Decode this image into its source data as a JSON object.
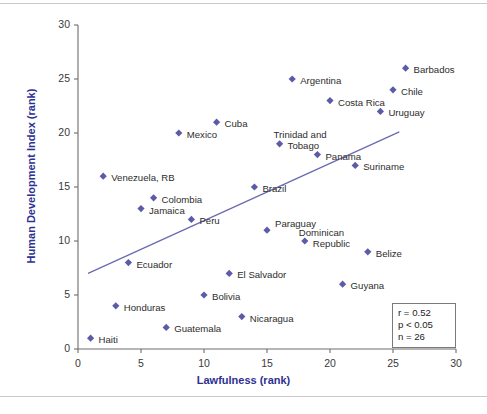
{
  "figure": {
    "xlabel": "Lawfulness (rank)",
    "ylabel": "Human Development Index (rank)",
    "accent_color": "#2e3192",
    "marker_color": "#5b5ba8",
    "trendline_color": "#6a6ab0"
  },
  "stats": {
    "r": "r = 0.52",
    "p": "p < 0.05",
    "n": "n = 26"
  },
  "chart_data": {
    "type": "scatter",
    "title": "",
    "xlabel": "Lawfulness (rank)",
    "ylabel": "Human Development Index (rank)",
    "xlim": [
      0,
      30
    ],
    "ylim": [
      0,
      30
    ],
    "xticks": [
      0,
      5,
      10,
      15,
      20,
      25,
      30
    ],
    "yticks": [
      0,
      5,
      10,
      15,
      20,
      25,
      30
    ],
    "grid": false,
    "legend": "none",
    "annotations": [
      "r = 0.52",
      "p < 0.05",
      "n = 26"
    ],
    "trendline": {
      "x": [
        0.8,
        25.5
      ],
      "y": [
        7.0,
        20.1
      ]
    },
    "points": [
      {
        "label": "Haiti",
        "x": 1,
        "y": 1,
        "lx": 8,
        "ly": -4
      },
      {
        "label": "Venezuela, RB",
        "x": 2,
        "y": 16,
        "lx": 8,
        "ly": -4
      },
      {
        "label": "Honduras",
        "x": 3,
        "y": 4,
        "lx": 8,
        "ly": -4
      },
      {
        "label": "Ecuador",
        "x": 4,
        "y": 8,
        "lx": 8,
        "ly": -4
      },
      {
        "label": "Jamaica",
        "x": 5,
        "y": 13,
        "lx": 8,
        "ly": -4
      },
      {
        "label": "Colombia",
        "x": 6,
        "y": 14,
        "lx": 8,
        "ly": -4
      },
      {
        "label": "Guatemala",
        "x": 7,
        "y": 2,
        "lx": 8,
        "ly": -4
      },
      {
        "label": "Mexico",
        "x": 8,
        "y": 20,
        "lx": 8,
        "ly": -4
      },
      {
        "label": "Peru",
        "x": 9,
        "y": 12,
        "lx": 8,
        "ly": -4
      },
      {
        "label": "Bolivia",
        "x": 10,
        "y": 5,
        "lx": 8,
        "ly": -4
      },
      {
        "label": "Cuba",
        "x": 11,
        "y": 21,
        "lx": 8,
        "ly": -4
      },
      {
        "label": "El Salvador",
        "x": 12,
        "y": 7,
        "lx": 8,
        "ly": -4
      },
      {
        "label": "Nicaragua",
        "x": 13,
        "y": 3,
        "lx": 8,
        "ly": -4
      },
      {
        "label": "Brazil",
        "x": 14,
        "y": 15,
        "lx": 8,
        "ly": -4
      },
      {
        "label": "Paraguay",
        "x": 15,
        "y": 11,
        "lx": 8,
        "ly": -12
      },
      {
        "label": "Trinidad and\nTobago",
        "x": 16,
        "y": 19,
        "lx": 8,
        "ly": -15
      },
      {
        "label": "Argentina",
        "x": 17,
        "y": 25,
        "lx": 8,
        "ly": -4
      },
      {
        "label": "Dominican\nRepublic",
        "x": 18,
        "y": 10,
        "lx": 8,
        "ly": -14
      },
      {
        "label": "Panama",
        "x": 19,
        "y": 18,
        "lx": 8,
        "ly": -4
      },
      {
        "label": "Costa Rica",
        "x": 20,
        "y": 23,
        "lx": 8,
        "ly": -4
      },
      {
        "label": "Guyana",
        "x": 21,
        "y": 6,
        "lx": 8,
        "ly": -4
      },
      {
        "label": "Suriname",
        "x": 22,
        "y": 17,
        "lx": 8,
        "ly": -4
      },
      {
        "label": "Belize",
        "x": 23,
        "y": 9,
        "lx": 8,
        "ly": -4
      },
      {
        "label": "Uruguay",
        "x": 24,
        "y": 22,
        "lx": 8,
        "ly": -4
      },
      {
        "label": "Chile",
        "x": 25,
        "y": 24,
        "lx": 8,
        "ly": -4
      },
      {
        "label": "Barbados",
        "x": 26,
        "y": 26,
        "lx": 8,
        "ly": -4
      }
    ]
  }
}
